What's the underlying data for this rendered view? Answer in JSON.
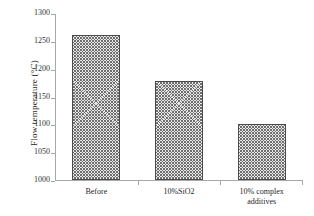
{
  "chart_data": {
    "type": "bar",
    "title": "",
    "xlabel": "",
    "ylabel": "Flow temperature (°C)",
    "categories": [
      "Before",
      "10%SiO2",
      "10% complex\nadditives"
    ],
    "values": [
      1260,
      1178,
      1100
    ],
    "ylim": [
      1000,
      1300
    ],
    "yticks": [
      1000,
      1050,
      1100,
      1150,
      1200,
      1250,
      1300
    ],
    "ytick_labels": [
      "1000",
      "1050",
      "1100",
      "1150",
      "1200",
      "1250",
      "1300"
    ],
    "grid": false,
    "legend": null,
    "series": [
      {
        "name": "Flow temperature",
        "values": [
          1260,
          1178,
          1100
        ]
      }
    ],
    "bar_fill": "hatched-crosshatch",
    "bar_edge_color": "#4a4a4a",
    "axis_color": "#a8a8a8",
    "background": "#ffffff"
  }
}
